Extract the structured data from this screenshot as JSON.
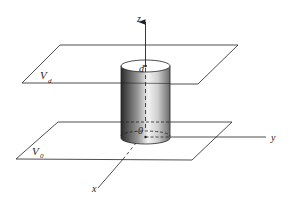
{
  "diagram": {
    "type": "3d-geometry",
    "axes": {
      "z": "z",
      "y": "y",
      "x": "x",
      "origin": "0"
    },
    "planes": {
      "top": {
        "label": "V",
        "subscript": "d"
      },
      "bottom": {
        "label": "V",
        "subscript": "0"
      }
    },
    "cylinder": {
      "top_label": "d"
    },
    "colors": {
      "line": "#222222",
      "cylinder_dark": "#2a2a2a",
      "cylinder_light": "#ffffff",
      "background": "#ffffff"
    }
  }
}
